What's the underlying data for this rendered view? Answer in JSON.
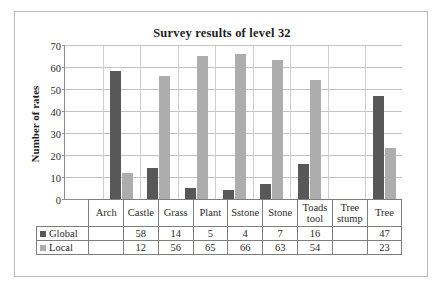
{
  "chart_data": {
    "type": "bar",
    "title": "Survey results of level 32",
    "xlabel": "",
    "ylabel": "Number of rates",
    "ylim": [
      0,
      70
    ],
    "ytick_step": 10,
    "yticks": [
      70,
      60,
      50,
      40,
      30,
      20,
      10,
      0
    ],
    "grid": true,
    "legend_position": "table-left",
    "categories": [
      "Arch",
      "Castle",
      "Grass",
      "Plant",
      "Sstone",
      "Stone",
      "Toads tool",
      "Tree stump",
      "Tree"
    ],
    "series": [
      {
        "name": "Global",
        "color": "#585858",
        "values": [
          null,
          58,
          14,
          5,
          4,
          7,
          16,
          null,
          47
        ],
        "display_values": [
          "",
          "58",
          "14",
          "5",
          "4",
          "7",
          "16",
          "",
          "47"
        ]
      },
      {
        "name": "Local",
        "color": "#adadad",
        "values": [
          null,
          12,
          56,
          65,
          66,
          63,
          54,
          null,
          23
        ],
        "display_values": [
          "",
          "12",
          "56",
          "65",
          "66",
          "63",
          "54",
          "",
          "23"
        ]
      }
    ]
  },
  "colors": {
    "global": "#585858",
    "local": "#adadad",
    "gridline": "#c2c2c2",
    "axis": "#8d8d8d",
    "table_border": "#7e7e7e",
    "frame": "#b9b9b9"
  }
}
